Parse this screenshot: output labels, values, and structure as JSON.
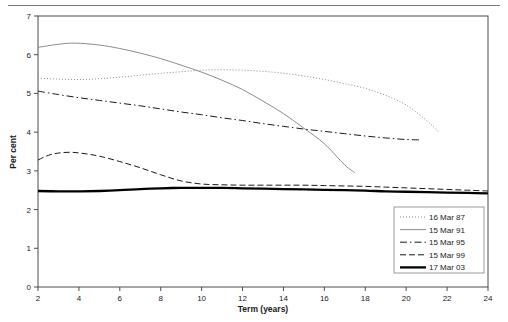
{
  "chart_data": {
    "type": "line",
    "title": "",
    "xlabel": "Term (years)",
    "ylabel": "Per cent",
    "xlim": [
      2,
      24
    ],
    "ylim": [
      0,
      7
    ],
    "xticks": [
      2,
      4,
      6,
      8,
      10,
      12,
      14,
      16,
      18,
      20,
      22,
      24
    ],
    "yticks": [
      0,
      1,
      2,
      3,
      4,
      5,
      6,
      7
    ],
    "grid": false,
    "legend_position": "bottom-right",
    "series": [
      {
        "name": "16 Mar 87",
        "style": "dotted",
        "color": "#8c8c8c",
        "width": 1,
        "x": [
          2,
          3,
          4,
          5,
          6,
          7,
          8,
          9,
          10,
          11,
          12,
          13,
          14,
          15,
          16,
          17,
          18,
          19,
          20,
          21,
          21.6
        ],
        "y": [
          5.4,
          5.37,
          5.36,
          5.38,
          5.42,
          5.47,
          5.52,
          5.56,
          5.6,
          5.61,
          5.6,
          5.57,
          5.52,
          5.45,
          5.36,
          5.25,
          5.13,
          4.95,
          4.7,
          4.3,
          4.0
        ]
      },
      {
        "name": "15 Mar 91",
        "style": "solid",
        "color": "#8c8c8c",
        "width": 1,
        "x": [
          2,
          3,
          3.8,
          5,
          6,
          7,
          8,
          9,
          10,
          11,
          12,
          13,
          14,
          15,
          16,
          17,
          17.5
        ],
        "y": [
          6.19,
          6.27,
          6.3,
          6.25,
          6.16,
          6.04,
          5.9,
          5.73,
          5.55,
          5.34,
          5.1,
          4.8,
          4.48,
          4.1,
          3.7,
          3.15,
          2.95
        ]
      },
      {
        "name": "15 Mar 95",
        "style": "dashdot",
        "color": "#1a1a1a",
        "width": 1,
        "x": [
          2,
          3,
          4,
          5,
          6,
          7,
          8,
          9,
          10,
          11,
          12,
          13,
          14,
          15,
          16,
          17,
          18,
          19,
          20,
          20.7
        ],
        "y": [
          5.06,
          4.97,
          4.89,
          4.82,
          4.75,
          4.68,
          4.6,
          4.52,
          4.45,
          4.37,
          4.3,
          4.22,
          4.15,
          4.08,
          4.02,
          3.96,
          3.9,
          3.85,
          3.81,
          3.8
        ]
      },
      {
        "name": "15 Mar 99",
        "style": "dashed",
        "color": "#1a1a1a",
        "width": 1,
        "x": [
          2,
          2.5,
          3,
          3.6,
          4.2,
          5,
          6,
          7,
          8,
          9,
          10,
          11,
          12,
          13,
          14,
          15,
          16,
          17,
          18,
          19,
          20,
          21,
          22,
          23,
          24
        ],
        "y": [
          3.28,
          3.4,
          3.46,
          3.48,
          3.45,
          3.38,
          3.24,
          3.08,
          2.9,
          2.74,
          2.66,
          2.64,
          2.63,
          2.63,
          2.63,
          2.63,
          2.62,
          2.61,
          2.6,
          2.58,
          2.56,
          2.54,
          2.52,
          2.5,
          2.48
        ]
      },
      {
        "name": "17 Mar 03",
        "style": "solid",
        "color": "#000000",
        "width": 2.3,
        "x": [
          2,
          3,
          4,
          5,
          6,
          7,
          8,
          9,
          10,
          11,
          12,
          13,
          14,
          15,
          16,
          17,
          18,
          19,
          20,
          21,
          22,
          23,
          24
        ],
        "y": [
          2.48,
          2.47,
          2.47,
          2.48,
          2.5,
          2.53,
          2.55,
          2.56,
          2.56,
          2.56,
          2.55,
          2.54,
          2.53,
          2.52,
          2.51,
          2.5,
          2.49,
          2.47,
          2.46,
          2.45,
          2.44,
          2.43,
          2.42
        ]
      }
    ]
  },
  "axes": {
    "x_tick_labels": [
      "2",
      "4",
      "6",
      "8",
      "10",
      "12",
      "14",
      "16",
      "18",
      "20",
      "22",
      "24"
    ],
    "y_tick_labels": [
      "0",
      "1",
      "2",
      "3",
      "4",
      "5",
      "6",
      "7"
    ],
    "x_title": "Term (years)",
    "y_title": "Per cent"
  },
  "legend": {
    "items": [
      {
        "label": "16 Mar 87"
      },
      {
        "label": "15 Mar 91"
      },
      {
        "label": "15 Mar 95"
      },
      {
        "label": "15 Mar 99"
      },
      {
        "label": "17 Mar 03"
      }
    ]
  }
}
